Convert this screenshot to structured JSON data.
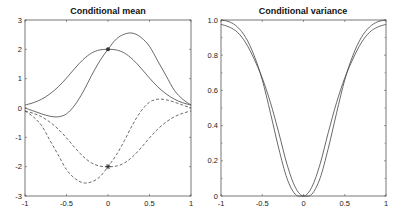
{
  "chart_data": [
    {
      "type": "line",
      "title": "Conditional mean",
      "xlabel": "",
      "ylabel": "",
      "xlim": [
        -1,
        1
      ],
      "ylim": [
        -3,
        3
      ],
      "xticks": [
        "-1",
        "-0.5",
        "0",
        "0.5",
        "1"
      ],
      "yticks": [
        "3",
        "2",
        "1",
        "0",
        "-1",
        "-2",
        "-3"
      ],
      "grid": false,
      "legend": null,
      "x": [
        -1,
        -0.9,
        -0.8,
        -0.7,
        -0.6,
        -0.5,
        -0.4,
        -0.3,
        -0.2,
        -0.1,
        0,
        0.1,
        0.2,
        0.3,
        0.4,
        0.5,
        0.6,
        0.7,
        0.8,
        0.9,
        1
      ],
      "series": [
        {
          "name": "mean-solid-1",
          "style": "solid",
          "values": [
            0.1,
            0.18,
            0.3,
            0.48,
            0.72,
            1.02,
            1.35,
            1.65,
            1.87,
            1.98,
            2.0,
            1.98,
            1.87,
            1.65,
            1.35,
            1.02,
            0.72,
            0.48,
            0.3,
            0.18,
            0.1
          ]
        },
        {
          "name": "mean-solid-2",
          "style": "solid",
          "values": [
            0.0,
            -0.1,
            -0.2,
            -0.28,
            -0.3,
            -0.2,
            0.1,
            0.55,
            1.1,
            1.6,
            2.0,
            2.35,
            2.52,
            2.55,
            2.4,
            2.1,
            1.6,
            1.1,
            0.6,
            0.3,
            0.1
          ]
        },
        {
          "name": "mean-dashed-1",
          "style": "dashed",
          "values": [
            -0.1,
            -0.18,
            -0.3,
            -0.48,
            -0.72,
            -1.02,
            -1.35,
            -1.65,
            -1.87,
            -1.98,
            -2.0,
            -1.98,
            -1.87,
            -1.65,
            -1.35,
            -1.02,
            -0.72,
            -0.48,
            -0.3,
            -0.18,
            -0.1
          ]
        },
        {
          "name": "mean-dashed-2",
          "style": "dashed",
          "values": [
            -0.1,
            -0.3,
            -0.6,
            -1.1,
            -1.6,
            -2.1,
            -2.4,
            -2.55,
            -2.52,
            -2.35,
            -2.0,
            -1.6,
            -1.1,
            -0.55,
            -0.1,
            0.2,
            0.3,
            0.28,
            0.2,
            0.1,
            0.0
          ]
        }
      ],
      "markers": [
        {
          "x": 0,
          "y": 2,
          "symbol": "dot"
        },
        {
          "x": 0,
          "y": -2,
          "symbol": "star"
        }
      ]
    },
    {
      "type": "line",
      "title": "Conditional variance",
      "xlabel": "",
      "ylabel": "",
      "xlim": [
        -1,
        1
      ],
      "ylim": [
        0,
        1.0
      ],
      "xticks": [
        "-1",
        "-0.5",
        "0",
        "0.5",
        "1"
      ],
      "yticks": [
        "1.0",
        "0.8",
        "0.6",
        "0.4",
        "0.2",
        "0"
      ],
      "grid": false,
      "legend": null,
      "x": [
        -1,
        -0.9,
        -0.8,
        -0.7,
        -0.6,
        -0.5,
        -0.4,
        -0.3,
        -0.2,
        -0.1,
        0,
        0.1,
        0.2,
        0.3,
        0.4,
        0.5,
        0.6,
        0.7,
        0.8,
        0.9,
        1
      ],
      "series": [
        {
          "name": "variance-1",
          "style": "solid",
          "values": [
            1.0,
            0.99,
            0.96,
            0.9,
            0.8,
            0.66,
            0.47,
            0.27,
            0.1,
            0.01,
            0,
            0.01,
            0.1,
            0.27,
            0.47,
            0.66,
            0.8,
            0.9,
            0.96,
            0.99,
            1.0
          ]
        },
        {
          "name": "variance-2",
          "style": "solid",
          "values": [
            0.975,
            0.96,
            0.93,
            0.87,
            0.78,
            0.67,
            0.53,
            0.36,
            0.18,
            0.05,
            0,
            0.05,
            0.18,
            0.36,
            0.53,
            0.67,
            0.78,
            0.87,
            0.93,
            0.96,
            0.975
          ]
        }
      ]
    }
  ]
}
